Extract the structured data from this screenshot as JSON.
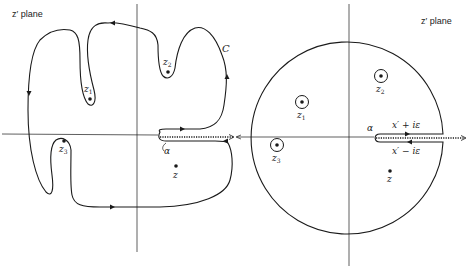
{
  "left_panel": {
    "plane_label": "z′ plane",
    "contour_label": "C",
    "points": [
      {
        "name": "z",
        "sub": "1"
      },
      {
        "name": "z",
        "sub": "2"
      },
      {
        "name": "z",
        "sub": "3"
      },
      {
        "name": "z",
        "sub": ""
      }
    ],
    "branch_point_label": "α"
  },
  "right_panel": {
    "plane_label": "z′ plane",
    "points": [
      {
        "name": "z",
        "sub": "1"
      },
      {
        "name": "z",
        "sub": "2"
      },
      {
        "name": "z",
        "sub": "3"
      },
      {
        "name": "z",
        "sub": ""
      }
    ],
    "branch_point_label": "α",
    "upper_edge_label": "x′ + iε",
    "lower_edge_label": "x′ − iε"
  },
  "colors": {
    "stroke": "#1a1a1a",
    "background": "#ffffff"
  }
}
